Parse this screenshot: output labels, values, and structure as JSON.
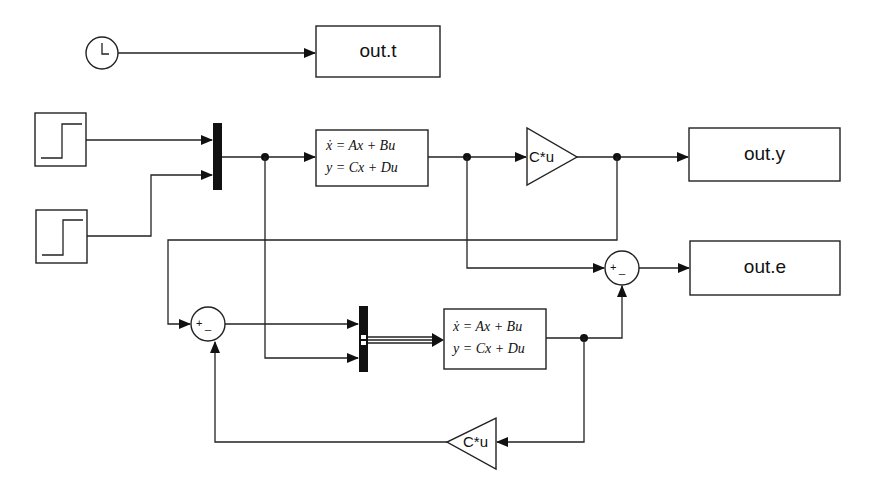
{
  "diagram": {
    "type": "simulink-block-diagram",
    "blocks": {
      "clock": {
        "label": "clock",
        "icon": "clock-icon"
      },
      "step1": {
        "label": "step",
        "icon": "step-icon"
      },
      "step2": {
        "label": "step",
        "icon": "step-icon"
      },
      "mux1": {
        "label": "mux"
      },
      "mux2": {
        "label": "mux"
      },
      "state_space_1": {
        "eq1": "ẋ = Ax + Bu",
        "eq2": "y = Cx + Du"
      },
      "state_space_2": {
        "eq1": "ẋ = Ax + Bu",
        "eq2": "y = Cx + Du"
      },
      "gain_1": {
        "label": "C*u"
      },
      "gain_2": {
        "label": "C*u"
      },
      "sum_1": {
        "plus": "+",
        "minus": "_"
      },
      "sum_2": {
        "plus": "+",
        "minus": "_"
      },
      "out_t": {
        "label": "out.t"
      },
      "out_y": {
        "label": "out.y"
      },
      "out_e": {
        "label": "out.e"
      }
    },
    "connections": [
      {
        "from": "clock",
        "to": "out_t"
      },
      {
        "from": "step1",
        "to": "mux1.in1"
      },
      {
        "from": "step2",
        "to": "mux1.in2"
      },
      {
        "from": "mux1",
        "to": "state_space_1"
      },
      {
        "from": "mux1",
        "to": "mux2.in2"
      },
      {
        "from": "state_space_1",
        "to": "gain_1"
      },
      {
        "from": "state_space_1",
        "to": "sum_2.plus"
      },
      {
        "from": "gain_1",
        "to": "out_y"
      },
      {
        "from": "gain_1",
        "to": "sum_1.plus"
      },
      {
        "from": "sum_1",
        "to": "mux2.in1"
      },
      {
        "from": "mux2",
        "to": "state_space_2"
      },
      {
        "from": "state_space_2",
        "to": "sum_2.minus"
      },
      {
        "from": "state_space_2",
        "to": "gain_2"
      },
      {
        "from": "gain_2",
        "to": "sum_1.minus"
      },
      {
        "from": "sum_2",
        "to": "out_e"
      }
    ]
  }
}
